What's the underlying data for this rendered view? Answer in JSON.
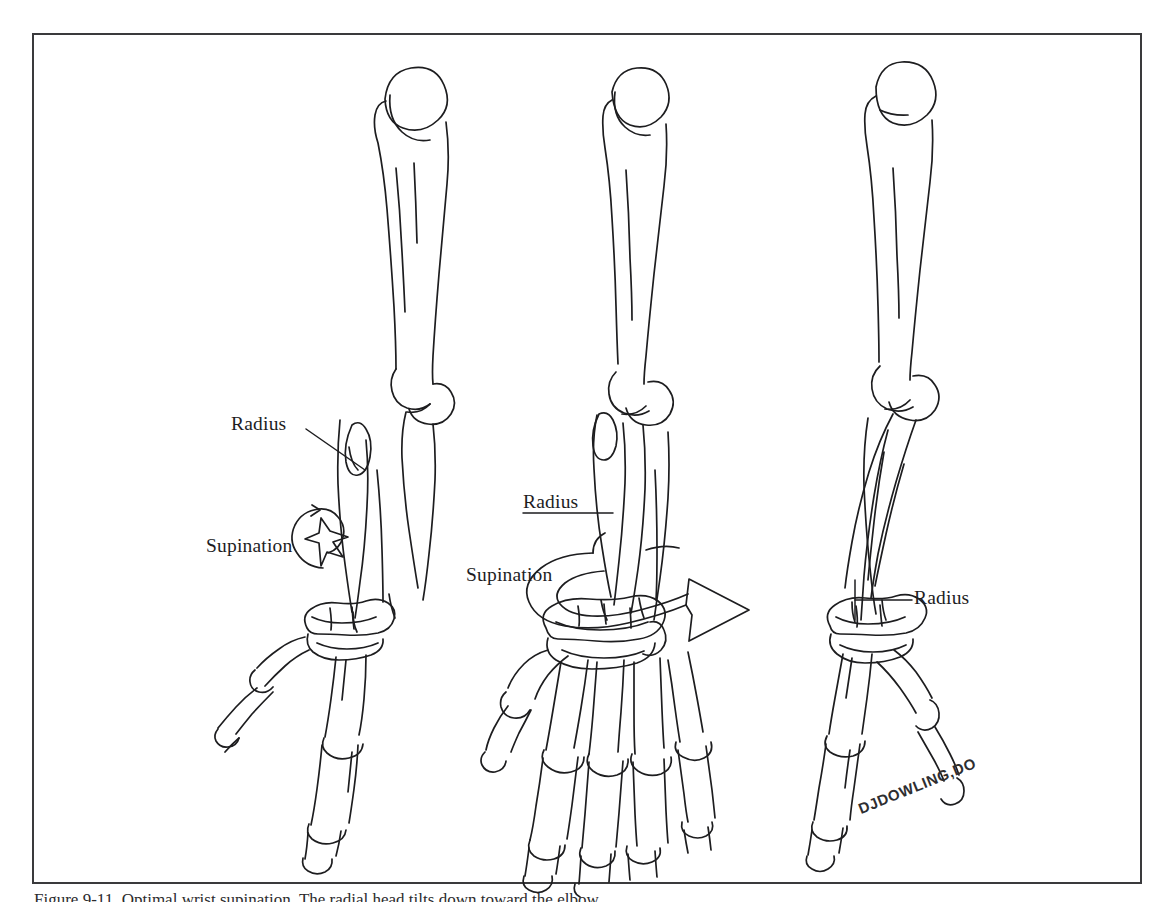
{
  "figure": {
    "kind": "anatomical-line-illustration",
    "background_color": "#ffffff",
    "ink_color": "#1d1d1f",
    "frame_color": "#3a3a3c"
  },
  "labels": {
    "radius_left": "Radius",
    "supination_left": "Supination",
    "radius_middle": "Radius",
    "supination_middle": "Supination",
    "radius_right": "Radius"
  },
  "signature": "DJDOWLING,DO",
  "caption": {
    "text": "Figure 9-11. Optimal wrist supination. The radial head tilts down toward the elbow."
  },
  "panels": [
    {
      "id": "left",
      "position": "left",
      "description": "Upper limb in partial supination, hand seen edge-on",
      "labels": [
        "Radius",
        "Supination"
      ],
      "bones": [
        "humerus",
        "radius",
        "ulna",
        "carpals",
        "metacarpals",
        "phalanges"
      ],
      "arrow": "curved-supination-arrow-small"
    },
    {
      "id": "middle",
      "position": "center",
      "description": "Upper limb in full supination, palm of hand facing viewer",
      "labels": [
        "Radius",
        "Supination"
      ],
      "bones": [
        "humerus",
        "radius",
        "ulna",
        "carpals",
        "metacarpals",
        "phalanges"
      ],
      "arrow": "curved-supination-arrow-large-3d"
    },
    {
      "id": "right",
      "position": "right",
      "description": "Upper limb in pronation, radius crossing over ulna",
      "labels": [
        "Radius"
      ],
      "bones": [
        "humerus",
        "radius",
        "ulna",
        "carpals",
        "metacarpals",
        "phalanges"
      ],
      "arrow": null
    }
  ]
}
